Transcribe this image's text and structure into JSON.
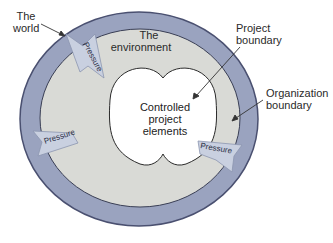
{
  "diagram": {
    "labels": {
      "world": [
        "The",
        "world"
      ],
      "environment": [
        "The",
        "environment"
      ],
      "project_boundary": [
        "Project",
        "boundary"
      ],
      "organization_boundary": [
        "Organization",
        "boundary"
      ],
      "center": [
        "Controlled",
        "project",
        "elements"
      ]
    },
    "pressure_arrows": [
      {
        "label": "Pressure",
        "position": "top-left"
      },
      {
        "label": "Pressure",
        "position": "left"
      },
      {
        "label": "Pressure",
        "position": "right"
      }
    ],
    "colors": {
      "outer_ring": "#9aa3bf",
      "inner_ring": "#d9dad6",
      "center": "#ffffff",
      "arrow_fill": "#c9d0e0",
      "outline": "#3a3f55"
    }
  }
}
